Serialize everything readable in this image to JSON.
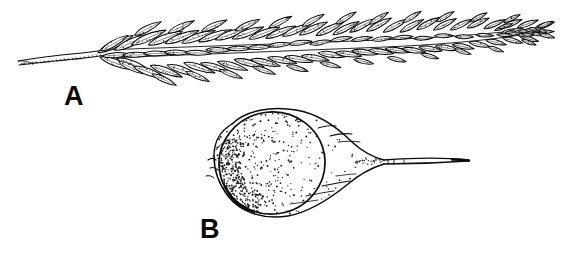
{
  "plate": {
    "width": 562,
    "height": 268,
    "background_color": "#ffffff",
    "ink_color": "#0d0d0d",
    "style": "black-and-white stippled pen-and-ink botanical line drawing"
  },
  "figures": [
    {
      "key": "A",
      "label": "A",
      "subject": "grass-spike-inflorescence",
      "description": "Elongate spike with a slender tapering stalk at left and densely overlapping lanceolate spikelets in two ranks, tapering to a narrow apex at right",
      "label_position": {
        "x": 64,
        "y": 83
      },
      "bounds": {
        "x": 18,
        "y": 8,
        "width": 527,
        "height": 70
      },
      "stalk": {
        "x_start": 18,
        "x_end": 102,
        "y": 58
      },
      "spikelet_count": 64,
      "spike_apex_x": 545
    },
    {
      "key": "B",
      "label": "B",
      "subject": "perigynium-with-achene",
      "description": "Inflated ovoid perigynium with stippled shading, an inner outlined achene, and a long tapering beak extending to the right",
      "label_position": {
        "x": 200,
        "y": 216
      },
      "bounds": {
        "x": 205,
        "y": 108,
        "width": 265,
        "height": 110
      },
      "body": {
        "cx": 290,
        "cy": 163,
        "rx": 85,
        "ry": 55
      },
      "achene": {
        "cx": 272,
        "cy": 163,
        "rx": 52,
        "ry": 50
      },
      "beak": {
        "x_start": 382,
        "x_end": 470,
        "y": 161
      },
      "stipple_dot_count": 620
    }
  ],
  "labels": {
    "figure_a": "A",
    "figure_b": "B"
  },
  "colors": {
    "ink": "#0d0d0d",
    "paper": "#ffffff",
    "label": "#0a0a0a",
    "stipple": "#1a1a1a"
  }
}
